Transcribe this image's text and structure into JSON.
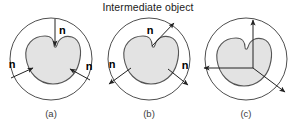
{
  "figure": {
    "title": "Intermediate object",
    "background_color": "#ffffff",
    "stroke_color": "#3a3a3a",
    "blob_fill_color": "#e3e3e3",
    "blob_stroke_color": "#555555",
    "arrow_color": "#222222",
    "label_color": "#000000",
    "caption_color": "#3d3d3d"
  },
  "panels": [
    {
      "id": "a",
      "caption": "(a)",
      "description": "normals pointing inward toward the intermediate object",
      "normal_direction": "inward",
      "vector_labels": [
        "n",
        "n",
        "n"
      ],
      "vectors": [
        {
          "name": "top-normal",
          "label": "n",
          "points": "inward-down"
        },
        {
          "name": "left-normal",
          "label": "n",
          "points": "inward-up-right"
        },
        {
          "name": "right-normal",
          "label": "n",
          "points": "inward-up-left"
        }
      ]
    },
    {
      "id": "b",
      "caption": "(b)",
      "description": "normals pointing outward away from the intermediate object",
      "normal_direction": "outward",
      "vector_labels": [
        "n",
        "n",
        "n"
      ],
      "vectors": [
        {
          "name": "top-normal",
          "label": "n",
          "points": "outward-up-right"
        },
        {
          "name": "left-normal",
          "label": "n",
          "points": "outward-down-left"
        },
        {
          "name": "right-normal",
          "label": "n",
          "points": "outward-down-right"
        }
      ]
    },
    {
      "id": "c",
      "caption": "(c)",
      "description": "unlabelled vectors radiating from a common interior origin",
      "normal_direction": "radial-from-interior-point",
      "vector_labels": [],
      "vectors": [
        {
          "name": "up-vector",
          "label": "",
          "points": "up"
        },
        {
          "name": "left-vector",
          "label": "",
          "points": "left"
        },
        {
          "name": "down-right-vector",
          "label": "",
          "points": "down-right"
        }
      ]
    }
  ]
}
